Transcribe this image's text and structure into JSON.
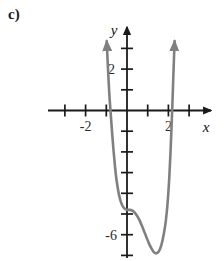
{
  "figure": {
    "part_label": "c)",
    "axis_color": "#1a1a1a",
    "curve_color": "#808080",
    "background": "#ffffff"
  },
  "axes": {
    "x_axis_label": "x",
    "y_axis_label": "y",
    "x_arrow": "arrow-right-icon",
    "y_arrow": "arrow-up-icon"
  },
  "chart_data": {
    "type": "line",
    "title": "",
    "xlabel": "x",
    "ylabel": "y",
    "xlim": [
      -3.8,
      4.2
    ],
    "ylim": [
      -8.2,
      3.5
    ],
    "grid": false,
    "legend": null,
    "x_ticks": [
      -3,
      -2,
      -1,
      1,
      2,
      3
    ],
    "x_tick_labels": [
      "",
      "-2",
      "",
      "",
      "2",
      ""
    ],
    "y_ticks": [
      3,
      2,
      1,
      -1,
      -2,
      -3,
      -4,
      -5,
      -6,
      -7
    ],
    "y_tick_labels": [
      "",
      "2",
      "",
      "",
      "",
      "",
      "",
      "",
      "-6",
      ""
    ],
    "labeled_x_values": [
      -2,
      2
    ],
    "labeled_y_values": [
      2,
      -6
    ],
    "annotations": [
      {
        "text": "c)",
        "role": "part-label"
      }
    ],
    "series": [
      {
        "name": "quartic-curve",
        "color": "#808080",
        "arrow_start": true,
        "arrow_end": true,
        "description": "Quartic polynomial with a flattened shoulder near x=0 at y=-4.8 and an absolute minimum near x=1.35 at y=-6.9; both branches rise steeply off the top of the frame.",
        "x_intercepts": [
          -0.72,
          2.05
        ],
        "local_minimum": {
          "x": 1.35,
          "y": -6.9
        },
        "shoulder": {
          "x": 0.05,
          "y": -4.8
        },
        "x": [
          -0.98,
          -0.95,
          -0.92,
          -0.89,
          -0.86,
          -0.82,
          -0.78,
          -0.74,
          -0.7,
          -0.64,
          -0.58,
          -0.52,
          -0.45,
          -0.38,
          -0.3,
          -0.22,
          -0.14,
          -0.06,
          0.02,
          0.12,
          0.22,
          0.34,
          0.46,
          0.58,
          0.7,
          0.82,
          0.94,
          1.06,
          1.18,
          1.3,
          1.42,
          1.54,
          1.66,
          1.78,
          1.88,
          1.97,
          2.05,
          2.12,
          2.18,
          2.23,
          2.27,
          2.3
        ],
        "y": [
          3.35,
          2.7,
          2.05,
          1.45,
          0.9,
          0.3,
          -0.25,
          -0.8,
          -1.32,
          -2.05,
          -2.7,
          -3.25,
          -3.72,
          -4.1,
          -4.4,
          -4.6,
          -4.72,
          -4.78,
          -4.8,
          -4.8,
          -4.82,
          -4.9,
          -5.05,
          -5.25,
          -5.52,
          -5.82,
          -6.12,
          -6.42,
          -6.66,
          -6.84,
          -6.9,
          -6.8,
          -6.5,
          -5.95,
          -5.3,
          -4.35,
          -3.1,
          -1.6,
          -0.05,
          1.4,
          2.55,
          3.35
        ]
      }
    ]
  }
}
